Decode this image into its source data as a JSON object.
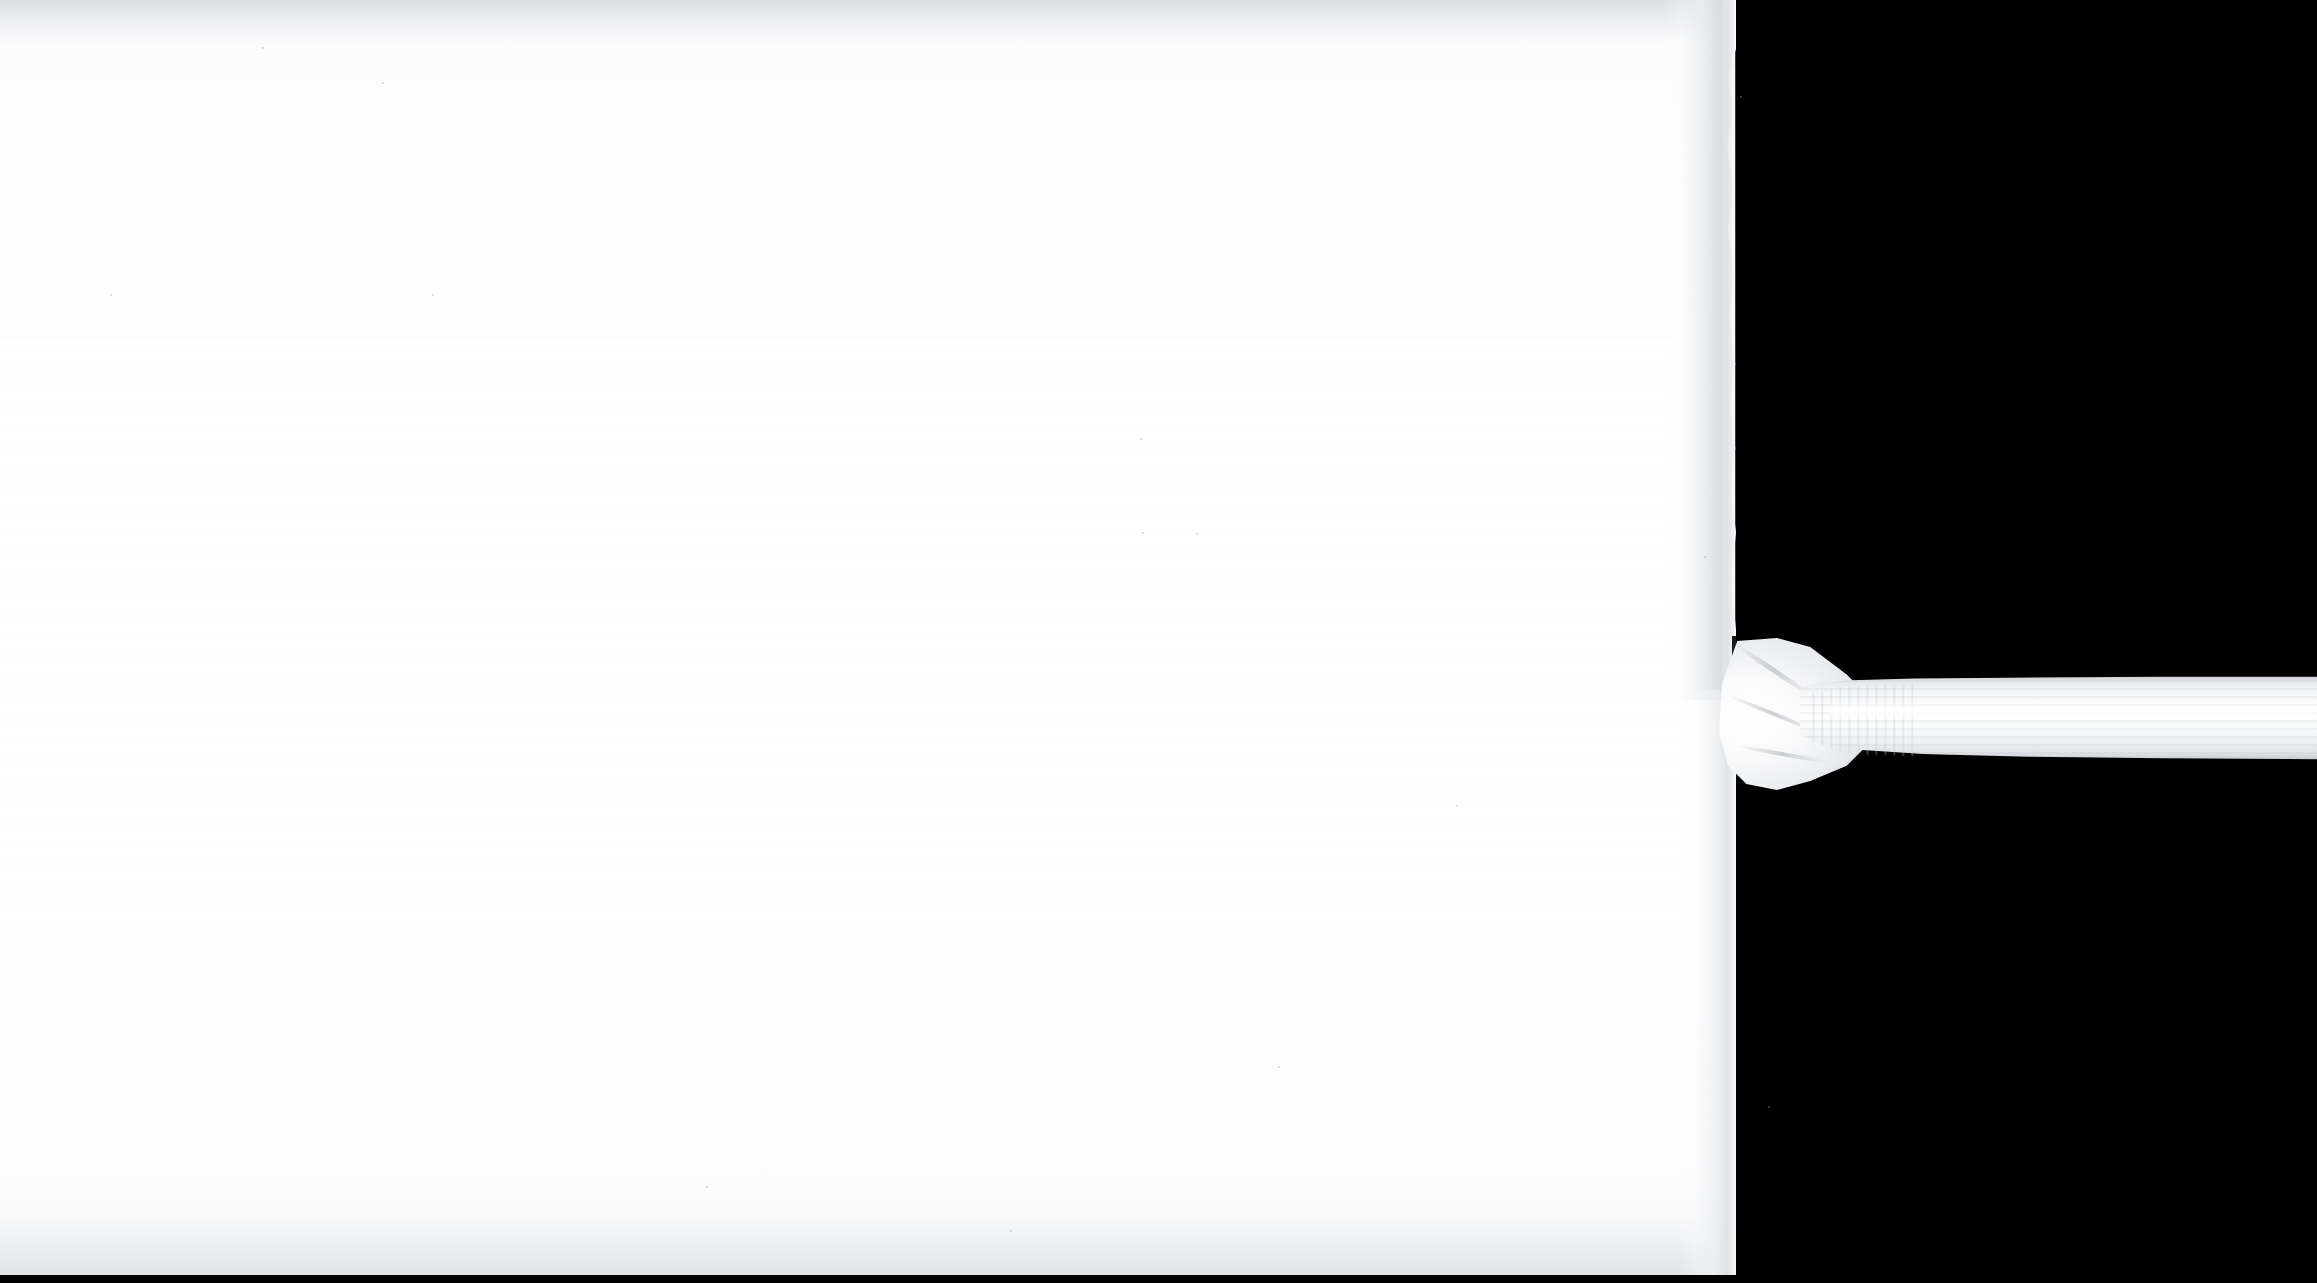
{
  "scene": {
    "title": "White ribbed sock on white surface against black background",
    "width": 2317,
    "height": 1283,
    "subject": "sock",
    "orientation": "horizontal",
    "caption": ""
  },
  "colors": {
    "background": "#000000",
    "white_field": "#ffffff",
    "field_top_tone": "#f2f3f4",
    "field_bottom_tone": "#f2f3f5",
    "sock_body": "#fafafb",
    "sock_shadow": "#cfd3d8",
    "rib_line": "#c4c8cd",
    "cuff_edge": "#c9ccd0"
  },
  "regions": {
    "black_backdrop": {
      "name": "black-backdrop",
      "x": 0,
      "y": 0,
      "width": 2317,
      "height": 1283
    },
    "white_field": {
      "name": "white-field",
      "x": 0,
      "y": 0,
      "width": 1735,
      "height": 1277
    },
    "sock_leg": {
      "name": "sock-leg",
      "x": 1664,
      "y": 0,
      "width": 72,
      "height": 700
    },
    "sock_ankle": {
      "name": "sock-ankle-fold",
      "x": 1716,
      "y": 638,
      "width": 152,
      "height": 152
    },
    "sock_cuff": {
      "name": "sock-ribbed-cuff",
      "x": 1800,
      "y": 676,
      "width": 517,
      "height": 84
    },
    "bottom_bar": {
      "name": "bottom-black-bar",
      "x": 0,
      "y": 1275,
      "width": 2317,
      "height": 8
    }
  },
  "specks": [
    {
      "x": 382,
      "y": 82,
      "size": 2
    },
    {
      "x": 262,
      "y": 47,
      "size": 2
    },
    {
      "x": 110,
      "y": 294,
      "size": 2
    },
    {
      "x": 432,
      "y": 294,
      "size": 2
    },
    {
      "x": 1140,
      "y": 438,
      "size": 2
    },
    {
      "x": 1142,
      "y": 532,
      "size": 2
    },
    {
      "x": 1196,
      "y": 533,
      "size": 2
    },
    {
      "x": 1456,
      "y": 805,
      "size": 2
    },
    {
      "x": 1278,
      "y": 1066,
      "size": 2
    },
    {
      "x": 1010,
      "y": 1230,
      "size": 2
    },
    {
      "x": 706,
      "y": 1186,
      "size": 2
    },
    {
      "x": 1704,
      "y": 556,
      "size": 2
    },
    {
      "x": 1740,
      "y": 96,
      "size": 2
    },
    {
      "x": 1768,
      "y": 1106,
      "size": 2
    }
  ],
  "labels": {
    "overlay_text": "",
    "watermark": ""
  }
}
